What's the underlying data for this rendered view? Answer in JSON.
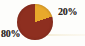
{
  "chart_data": {
    "type": "pie",
    "title": "",
    "subtitle": "",
    "xlabel": "",
    "ylabel": "",
    "legend_position": "none",
    "grid": false,
    "labels": [
      "80%",
      "20%"
    ],
    "values": [
      80,
      20
    ],
    "value_unit": "%",
    "slices": [
      {
        "label": "80%",
        "value": 80,
        "color": "#8e2f20",
        "start_angle_deg": 72,
        "end_angle_deg": 360
      },
      {
        "label": "20%",
        "value": 20,
        "color": "#e8a92b",
        "start_angle_deg": 0,
        "end_angle_deg": 72
      }
    ],
    "annotations": []
  },
  "figure": {
    "background_color": "#fdfdfb",
    "major_slice_label": "80%",
    "minor_slice_label": "20%",
    "major_slice_color": "#8e2f20",
    "minor_slice_color": "#e8a92b",
    "label_text_color": "#2e2a26"
  }
}
